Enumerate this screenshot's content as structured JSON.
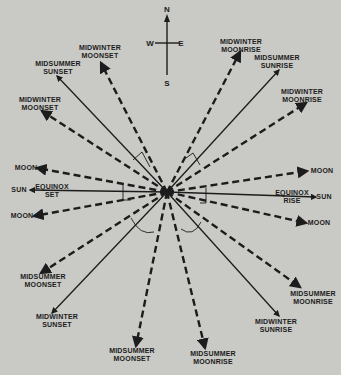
{
  "compass": {
    "north": "N",
    "south": "S",
    "east": "E",
    "west": "W"
  },
  "labels": {
    "nw_outer": "MIDWINTER\nMOONSET",
    "nw_mid": "MIDSUMMER\nSUNSET",
    "nw_inner": "MIDWINTER\nMOONSET",
    "ne_outer": "MIDWINTER\nMOONRISE",
    "ne_mid": "MIDSUMMER\nSUNRISE",
    "ne_inner": "MIDWINTER\nMOONRISE",
    "w_moon_upper": "MOON",
    "w_sun": "SUN",
    "w_equinox": "EQUINOX\nSET",
    "w_moon_lower": "MOON",
    "e_moon_upper": "MOON",
    "e_sun": "SUN",
    "e_equinox": "EQUINOX\nRISE",
    "e_moon_lower": "MOON",
    "sw_inner": "MIDSUMMER\nMOONSET",
    "sw_mid": "MIDWINTER\nSUNSET",
    "sw_outer": "MIDSUMMER\nMOONSET",
    "se_inner": "MIDSUMMER\nMOONRISE",
    "se_mid": "MIDWINTER\nSUNRISE",
    "se_outer": "MIDSUMMER\nMOONRISE"
  },
  "rays": [
    {
      "id": "midwinter-moonset-nw-outer",
      "body": "moon",
      "style": "dashed"
    },
    {
      "id": "midsummer-sunset",
      "body": "sun",
      "style": "solid"
    },
    {
      "id": "midwinter-moonset-nw-inner",
      "body": "moon",
      "style": "dashed"
    },
    {
      "id": "moon-west-upper",
      "body": "moon",
      "style": "dashed"
    },
    {
      "id": "equinox-set",
      "body": "sun",
      "style": "solid"
    },
    {
      "id": "moon-west-lower",
      "body": "moon",
      "style": "dashed"
    },
    {
      "id": "midsummer-moonset-sw-inner",
      "body": "moon",
      "style": "dashed"
    },
    {
      "id": "midwinter-sunset",
      "body": "sun",
      "style": "solid"
    },
    {
      "id": "midsummer-moonset-sw-outer",
      "body": "moon",
      "style": "dashed"
    },
    {
      "id": "midwinter-moonrise-ne-outer",
      "body": "moon",
      "style": "dashed"
    },
    {
      "id": "midsummer-sunrise",
      "body": "sun",
      "style": "solid"
    },
    {
      "id": "midwinter-moonrise-ne-inner",
      "body": "moon",
      "style": "dashed"
    },
    {
      "id": "moon-east-upper",
      "body": "moon",
      "style": "dashed"
    },
    {
      "id": "equinox-rise",
      "body": "sun",
      "style": "solid"
    },
    {
      "id": "moon-east-lower",
      "body": "moon",
      "style": "dashed"
    },
    {
      "id": "midsummer-moonrise-se-inner",
      "body": "moon",
      "style": "dashed"
    },
    {
      "id": "midwinter-sunrise",
      "body": "sun",
      "style": "solid"
    },
    {
      "id": "midsummer-moonrise-se-outer",
      "body": "moon",
      "style": "dashed"
    }
  ],
  "colors": {
    "background": "#c9c9c5",
    "ink": "#1c1c1c"
  }
}
